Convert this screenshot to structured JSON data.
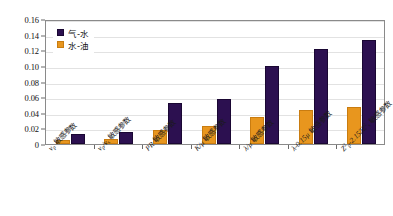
{
  "chart_data": {
    "type": "bar",
    "title": "",
    "subtitle": "",
    "xlabel": "",
    "ylabel": "",
    "ylim": [
      0,
      0.16
    ],
    "ytick_labels": [
      "0.16",
      "0.14",
      "0.12",
      "0.10",
      "0.08",
      "0.06",
      "0.04",
      "0.02",
      "0"
    ],
    "ytick_values": [
      0.16,
      0.14,
      0.12,
      0.1,
      0.08,
      0.06,
      0.04,
      0.02,
      0
    ],
    "grid": true,
    "legend_position": "top-left",
    "categories": [
      "v_p 敏感参数",
      "v_p/v_s 敏感参数",
      "PR 敏感参数",
      "K/μ 敏感参数",
      "λ/μ 敏感参数",
      "λ-0.15μ 敏感参数",
      "Z²p-2.152Z²s 敏感参数"
    ],
    "category_parts": [
      [
        {
          "t": "v",
          "k": "it"
        },
        {
          "t": "p",
          "k": "sub"
        },
        {
          "t": " 敏感参数",
          "k": "cjk"
        }
      ],
      [
        {
          "t": "v",
          "k": "it"
        },
        {
          "t": "p",
          "k": "sub"
        },
        {
          "t": "/",
          "k": "it"
        },
        {
          "t": "v",
          "k": "it"
        },
        {
          "t": "s",
          "k": "sub"
        },
        {
          "t": " 敏感参数",
          "k": "cjk"
        }
      ],
      [
        {
          "t": "PR",
          "k": "it"
        },
        {
          "t": " 敏感参数",
          "k": "cjk"
        }
      ],
      [
        {
          "t": "K/μ",
          "k": "it"
        },
        {
          "t": " 敏感参数",
          "k": "cjk"
        }
      ],
      [
        {
          "t": "λ/μ",
          "k": "it"
        },
        {
          "t": " 敏感参数",
          "k": "cjk"
        }
      ],
      [
        {
          "t": "λ-0.15μ",
          "k": "it"
        },
        {
          "t": " 敏感参数",
          "k": "cjk"
        }
      ],
      [
        {
          "t": "Z",
          "k": "it"
        },
        {
          "t": "2",
          "k": "sup"
        },
        {
          "t": "p",
          "k": "sub"
        },
        {
          "t": "-2.152",
          "k": "it"
        },
        {
          "t": "Z",
          "k": "it"
        },
        {
          "t": "2",
          "k": "sup"
        },
        {
          "t": "s",
          "k": "sub"
        },
        {
          "t": " 敏感参数",
          "k": "cjk"
        }
      ]
    ],
    "series": [
      {
        "name": "气-水",
        "color": "#2c1050",
        "values": [
          0.013,
          0.015,
          0.052,
          0.058,
          0.1,
          0.122,
          0.133
        ]
      },
      {
        "name": "水-油",
        "color": "#e8961e",
        "values": [
          0.005,
          0.006,
          0.018,
          0.023,
          0.035,
          0.044,
          0.048
        ]
      }
    ]
  },
  "legend": {
    "items": [
      {
        "label": "气-水",
        "color": "#2c1050"
      },
      {
        "label": "水-油",
        "color": "#e8961e"
      }
    ]
  }
}
